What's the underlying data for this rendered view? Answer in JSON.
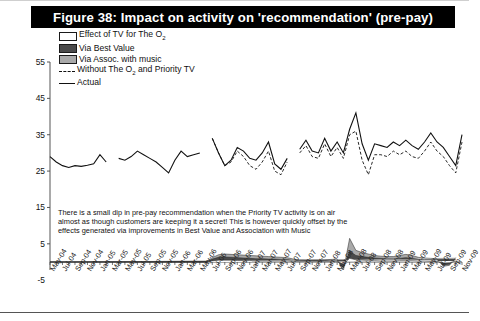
{
  "figure": {
    "title": "Figure 38: Impact on activity on 'recommendation' (pre-pay)"
  },
  "legend": {
    "items": [
      {
        "label": "Effect of TV for The O",
        "sub": "2",
        "key": "white-swatch"
      },
      {
        "label": "Via Best Value",
        "sub": "",
        "key": "dark-gray-swatch"
      },
      {
        "label": "Via Assoc. with music",
        "sub": "",
        "key": "light-gray-swatch"
      },
      {
        "label": "Without The O",
        "sub": "2",
        "label2": " and Priority TV",
        "key": "dashed-line"
      },
      {
        "label": "Actual",
        "sub": "",
        "key": "solid-line"
      }
    ]
  },
  "annotation": {
    "text": "There is a small dip in pre-pay recommendation when the Priority TV activity is on air almost as though customers are keeping it a secret! This is however quickly offset by the effects generated via improvements in Best Value and Association with Music"
  },
  "colors": {
    "title_bg": "#000000",
    "title_fg": "#ffffff",
    "line_actual": "#111111",
    "line_without": "#111111",
    "band_o2": "#ffffff",
    "band_best_value": "#4a4a4a",
    "band_music": "#a9a9a9",
    "axis": "#555555"
  },
  "chart_data": {
    "type": "line",
    "title": "Figure 38: Impact on activity on 'recommendation' (pre-pay)",
    "xlabel": "",
    "ylabel": "",
    "ylim": [
      -5,
      55
    ],
    "yticks": [
      -5,
      5,
      15,
      25,
      35,
      45,
      55
    ],
    "grid": false,
    "legend_position": "top-left",
    "x_tick_labels": [
      "May-04",
      "Jul-04",
      "Sep-04",
      "Nov-04",
      "Jan-05",
      "Mar-05",
      "May-05",
      "Jul-05",
      "Sep-05",
      "Nov-05",
      "Jan-06",
      "Mar-06",
      "May-06",
      "Jul-06",
      "Sep-06",
      "Nov-06",
      "Jan-07",
      "Mar-07",
      "May-07",
      "Jul-07",
      "Sep-07",
      "Nov-07",
      "Jan-08",
      "Mar-08",
      "May-08",
      "Jul-08",
      "Sep-08",
      "Nov-08",
      "Jan-09",
      "Mar-09",
      "May-09",
      "Jul-09",
      "Sep-09",
      "Nov-09"
    ],
    "x_months": [
      "May-04",
      "Jun-04",
      "Jul-04",
      "Aug-04",
      "Sep-04",
      "Oct-04",
      "Nov-04",
      "Dec-04",
      "Jan-05",
      "Feb-05",
      "Mar-05",
      "Apr-05",
      "May-05",
      "Jun-05",
      "Jul-05",
      "Aug-05",
      "Sep-05",
      "Oct-05",
      "Nov-05",
      "Dec-05",
      "Jan-06",
      "Feb-06",
      "Mar-06",
      "Apr-06",
      "May-06",
      "Jun-06",
      "Jul-06",
      "Aug-06",
      "Sep-06",
      "Oct-06",
      "Nov-06",
      "Dec-06",
      "Jan-07",
      "Feb-07",
      "Mar-07",
      "Apr-07",
      "May-07",
      "Jun-07",
      "Jul-07",
      "Aug-07",
      "Sep-07",
      "Oct-07",
      "Nov-07",
      "Dec-07",
      "Jan-08",
      "Feb-08",
      "Mar-08",
      "Apr-08",
      "May-08",
      "Jun-08",
      "Jul-08",
      "Aug-08",
      "Sep-08",
      "Oct-08",
      "Nov-08",
      "Dec-08",
      "Jan-09",
      "Feb-09",
      "Mar-09",
      "Apr-09",
      "May-09",
      "Jun-09",
      "Jul-09",
      "Aug-09",
      "Sep-09",
      "Oct-09",
      "Nov-09"
    ],
    "series": [
      {
        "name": "Actual",
        "style": "solid",
        "values": [
          29.0,
          27.5,
          26.5,
          26.0,
          26.5,
          26.3,
          26.6,
          27.0,
          29.5,
          27.5,
          null,
          28.5,
          28.0,
          29.0,
          30.5,
          29.5,
          28.5,
          27.5,
          26.0,
          24.5,
          28.0,
          30.5,
          29.0,
          29.5,
          30.0,
          null,
          34.0,
          30.0,
          26.5,
          28.0,
          31.5,
          30.5,
          28.5,
          28.0,
          30.0,
          33.0,
          27.0,
          25.5,
          28.5,
          null,
          31.0,
          33.5,
          30.5,
          30.0,
          34.0,
          30.5,
          33.0,
          30.0,
          36.5,
          41.0,
          32.5,
          28.0,
          32.5,
          32.0,
          31.5,
          33.0,
          32.0,
          33.5,
          32.0,
          31.0,
          33.0,
          35.5,
          33.0,
          31.5,
          29.0,
          26.5,
          35.0
        ]
      },
      {
        "name": "Without The O2 and Priority TV",
        "style": "dashed",
        "values": [
          null,
          null,
          null,
          null,
          null,
          null,
          null,
          null,
          null,
          null,
          null,
          null,
          null,
          null,
          null,
          null,
          null,
          null,
          null,
          null,
          null,
          null,
          null,
          null,
          null,
          null,
          34.0,
          30.0,
          26.5,
          27.5,
          30.5,
          29.0,
          26.5,
          25.5,
          27.5,
          30.5,
          25.0,
          24.0,
          27.5,
          null,
          30.0,
          32.0,
          29.0,
          28.5,
          32.5,
          29.0,
          31.5,
          28.5,
          35.0,
          36.0,
          28.0,
          24.0,
          29.5,
          29.5,
          29.0,
          30.5,
          29.5,
          30.5,
          29.0,
          28.5,
          30.5,
          33.0,
          30.5,
          29.0,
          26.5,
          24.5,
          33.0
        ]
      }
    ],
    "bands": [
      {
        "name": "Via Assoc. with music",
        "fill": "#a9a9a9",
        "values": [
          0,
          0,
          0,
          0,
          0,
          0,
          0,
          0,
          0,
          0,
          0,
          0,
          0,
          0,
          0,
          0,
          0,
          0,
          0,
          0,
          0,
          0,
          0,
          0,
          0,
          0,
          1.2,
          2.0,
          2.2,
          2.1,
          2.0,
          1.9,
          1.8,
          1.7,
          1.6,
          1.5,
          1.4,
          1.3,
          1.2,
          0.8,
          0.6,
          0.5,
          0.5,
          0.5,
          0.6,
          0.7,
          0.8,
          -2.4,
          6.5,
          3.2,
          2.6,
          2.2,
          1.8,
          1.6,
          1.5,
          1.5,
          1.8,
          2.1,
          1.8,
          1.3,
          1.1,
          1.0,
          0.9,
          -1.2,
          -0.9,
          1.2
        ]
      },
      {
        "name": "Via Best Value",
        "fill": "#4a4a4a",
        "values": [
          0,
          0,
          0,
          0,
          0,
          0,
          0,
          0,
          0,
          0,
          0,
          0,
          0,
          0,
          0,
          0,
          0,
          0,
          0,
          0,
          0,
          0,
          0,
          0,
          0,
          0,
          0.8,
          1.3,
          1.4,
          1.3,
          1.2,
          1.1,
          1.0,
          0.9,
          0.9,
          0.8,
          0.8,
          0.7,
          0.7,
          0.5,
          0.4,
          0.4,
          0.4,
          0.4,
          0.4,
          0.5,
          0.5,
          -1.6,
          3.0,
          1.8,
          1.5,
          1.3,
          1.1,
          1.0,
          0.9,
          0.9,
          1.0,
          1.2,
          1.0,
          0.8,
          0.7,
          0.6,
          0.6,
          -0.8,
          -0.6,
          0.8
        ]
      },
      {
        "name": "Effect of TV for The O2",
        "fill": "#ffffff",
        "values": [
          0,
          0,
          0,
          0,
          0,
          0,
          0,
          0,
          0,
          0,
          0,
          0,
          0,
          0,
          0,
          0,
          0,
          0,
          0,
          0,
          0,
          0,
          0,
          0,
          0,
          0,
          0.3,
          0.5,
          0.5,
          0.5,
          0.4,
          0.4,
          0.4,
          0.3,
          0.3,
          0.3,
          0.3,
          0.3,
          0.3,
          0.2,
          0.2,
          0.2,
          0.2,
          0.2,
          0.2,
          0.2,
          0.2,
          -0.6,
          1.0,
          0.6,
          0.5,
          0.4,
          0.4,
          0.3,
          0.3,
          0.3,
          0.4,
          0.4,
          0.4,
          0.3,
          0.3,
          0.2,
          0.2,
          -0.3,
          -0.2,
          0.3
        ]
      }
    ]
  }
}
